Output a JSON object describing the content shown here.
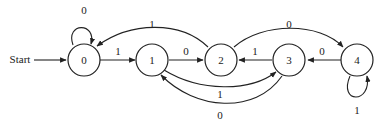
{
  "diagram": {
    "type": "finite-state-machine",
    "start_label": "Start",
    "start_state": "0",
    "states": [
      {
        "id": "0",
        "label": "0"
      },
      {
        "id": "1",
        "label": "1"
      },
      {
        "id": "2",
        "label": "2"
      },
      {
        "id": "3",
        "label": "3"
      },
      {
        "id": "4",
        "label": "4"
      }
    ],
    "transitions": [
      {
        "from": "0",
        "to": "0",
        "label": "0"
      },
      {
        "from": "0",
        "to": "1",
        "label": "1"
      },
      {
        "from": "1",
        "to": "2",
        "label": "0"
      },
      {
        "from": "2",
        "to": "0",
        "label": "1"
      },
      {
        "from": "2",
        "to": "4",
        "label": "0"
      },
      {
        "from": "3",
        "to": "2",
        "label": "1"
      },
      {
        "from": "1",
        "to": "3",
        "label": "1"
      },
      {
        "from": "3",
        "to": "1",
        "label": "0"
      },
      {
        "from": "4",
        "to": "3",
        "label": "0"
      },
      {
        "from": "4",
        "to": "4",
        "label": "1"
      }
    ]
  }
}
